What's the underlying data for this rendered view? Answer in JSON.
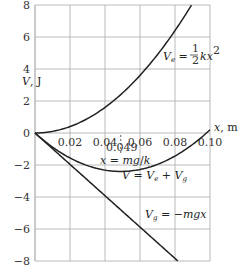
{
  "chart_data": {
    "type": "line",
    "title": "",
    "xlabel": "x, m",
    "ylabel": "V, J",
    "xlim": [
      0,
      0.1
    ],
    "ylim": [
      -8,
      8
    ],
    "grid": true,
    "x_ticks": [
      "0.02",
      "0.04",
      "0.06",
      "0.08",
      "0.10"
    ],
    "y_ticks": [
      "8",
      "6",
      "4",
      "2",
      "0",
      "−2",
      "−4",
      "−6",
      "−8"
    ],
    "x": [
      0,
      0.01,
      0.02,
      0.03,
      0.04,
      0.049,
      0.06,
      0.07,
      0.08,
      0.09,
      0.1
    ],
    "series": [
      {
        "name": "V_e = ½kx²",
        "values": [
          0,
          0.1,
          0.4,
          0.9,
          1.6,
          2.4,
          3.6,
          4.9,
          6.4,
          8.1,
          10.0
        ]
      },
      {
        "name": "V = V_e + V_g",
        "values": [
          0,
          -0.88,
          -1.56,
          -2.04,
          -2.32,
          -2.4,
          -2.28,
          -1.96,
          -1.44,
          -0.72,
          0.2
        ]
      },
      {
        "name": "V_g = −mgx",
        "values": [
          0,
          -0.98,
          -1.96,
          -2.94,
          -3.92,
          -4.8,
          -5.88,
          -6.86,
          -7.84,
          -8.82,
          -9.8
        ]
      }
    ],
    "annotations": [
      {
        "text": "0.049",
        "x": 0.049
      },
      {
        "text": "x = mg/k",
        "x": 0.049
      }
    ]
  },
  "labels": {
    "y_axis": "V, J",
    "x_axis": "x, m",
    "ve": "V_e = ½kx²",
    "v": "V = V_e + V_g",
    "vg": "V_g = −mgx",
    "marker_value": "0.049",
    "marker_eq": "x = mg/k"
  },
  "colors": {
    "grid": "#a8a8a8",
    "curve": "#222222",
    "text": "#333333"
  }
}
